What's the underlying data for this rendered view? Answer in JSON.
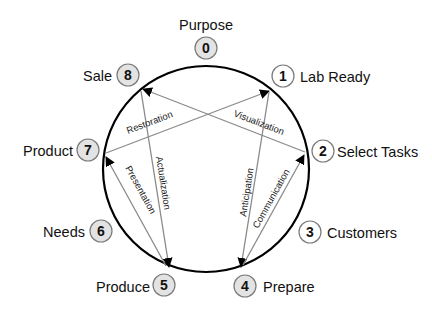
{
  "diagram": {
    "type": "cycle",
    "colors": {
      "ring": "#000000",
      "arrow": "#8a8a8a",
      "node_filled": "#e3e3e3",
      "node_empty": "#ffffff",
      "node_stroke": "#7a7a7a"
    },
    "nodes": [
      {
        "id": "0",
        "label": "Purpose"
      },
      {
        "id": "1",
        "label": "Lab Ready"
      },
      {
        "id": "2",
        "label": "Select Tasks"
      },
      {
        "id": "3",
        "label": "Customers"
      },
      {
        "id": "4",
        "label": "Prepare"
      },
      {
        "id": "5",
        "label": "Produce"
      },
      {
        "id": "6",
        "label": "Needs"
      },
      {
        "id": "7",
        "label": "Product"
      },
      {
        "id": "8",
        "label": "Sale"
      }
    ],
    "edges": [
      {
        "from": "7",
        "to": "1",
        "label": "Restoration"
      },
      {
        "from": "2",
        "to": "8",
        "label": "Visualization"
      },
      {
        "from": "8",
        "to": "5",
        "label": "Actualization"
      },
      {
        "from": "5",
        "to": "7",
        "label": "Presentation"
      },
      {
        "from": "1",
        "to": "4",
        "label": "Anticipation"
      },
      {
        "from": "4",
        "to": "2",
        "label": "Communication"
      }
    ]
  }
}
